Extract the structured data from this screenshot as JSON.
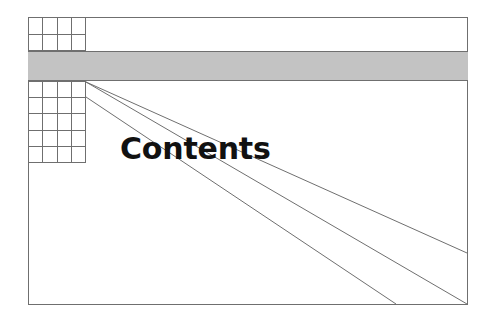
{
  "page": {
    "width": 491,
    "height": 323,
    "background_color": "#ffffff"
  },
  "figure": {
    "title": "Contents",
    "frame": {
      "stroke_color": "#6f6f6f",
      "fill_color": "#ffffff",
      "x": 28,
      "y": 17,
      "width": 440,
      "height": 288
    },
    "band": {
      "name": "horizontal-gray-band",
      "fill_color": "#c3c3c3",
      "stroke_color": "#6f6f6f",
      "x": 28,
      "y": 51,
      "width": 440,
      "height": 30
    },
    "grids": [
      {
        "name": "top-left-grid",
        "columns": 4,
        "rows": 2,
        "x": 28,
        "y": 17,
        "width": 58,
        "height": 34,
        "stroke_color": "#6f6f6f"
      },
      {
        "name": "lower-left-grid",
        "columns": 4,
        "rows": 5,
        "x": 28,
        "y": 81,
        "width": 58,
        "height": 82,
        "stroke_color": "#6f6f6f"
      }
    ],
    "leader_lines": [
      {
        "name": "leader-line-1",
        "x1": 86,
        "y1": 82,
        "x2": 467,
        "y2": 253,
        "stroke_color": "#6f6f6f"
      },
      {
        "name": "leader-line-2",
        "x1": 86,
        "y1": 82,
        "x2": 467,
        "y2": 304,
        "stroke_color": "#6f6f6f"
      },
      {
        "name": "leader-line-3",
        "x1": 86,
        "y1": 97,
        "x2": 396,
        "y2": 304,
        "stroke_color": "#6f6f6f"
      }
    ]
  }
}
